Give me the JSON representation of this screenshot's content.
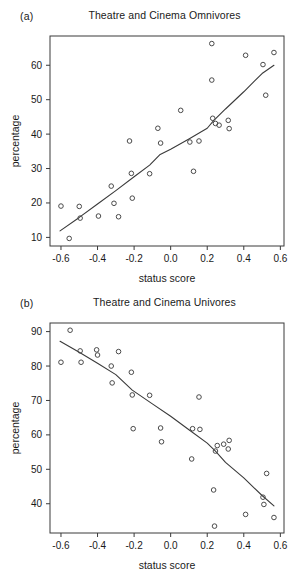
{
  "figure": {
    "xlabel": "status score",
    "ylabel": "percentage"
  },
  "panels": [
    {
      "letter": "(a)",
      "title": "Theatre and Cinema Omnivores"
    },
    {
      "letter": "(b)",
      "title": "Theatre and Cinema Univores"
    }
  ],
  "chart_data": [
    {
      "type": "scatter",
      "panel": "(a)",
      "title": "Theatre and Cinema Omnivores",
      "xlabel": "status score",
      "ylabel": "percentage",
      "xlim": [
        -0.66,
        0.62
      ],
      "ylim": [
        7.5,
        68.5
      ],
      "xticks": [
        -0.6,
        -0.4,
        -0.2,
        0.0,
        0.2,
        0.4,
        0.6
      ],
      "xticklabels": [
        "-0.6",
        "-0.4",
        "-0.2",
        "0.0",
        "0.2",
        "0.4",
        "0.6"
      ],
      "yticks": [
        10,
        20,
        30,
        40,
        50,
        60
      ],
      "yticklabels": [
        "10",
        "20",
        "30",
        "40",
        "50",
        "60"
      ],
      "grid": false,
      "legend": "none",
      "marker": "open-circle",
      "points": [
        {
          "x": -0.6,
          "y": 19.1
        },
        {
          "x": -0.555,
          "y": 9.7
        },
        {
          "x": -0.5,
          "y": 19.0
        },
        {
          "x": -0.495,
          "y": 15.6
        },
        {
          "x": -0.395,
          "y": 16.2
        },
        {
          "x": -0.325,
          "y": 24.9
        },
        {
          "x": -0.31,
          "y": 19.9
        },
        {
          "x": -0.285,
          "y": 16.0
        },
        {
          "x": -0.225,
          "y": 38.0
        },
        {
          "x": -0.215,
          "y": 28.6
        },
        {
          "x": -0.21,
          "y": 21.4
        },
        {
          "x": -0.115,
          "y": 28.5
        },
        {
          "x": -0.07,
          "y": 41.7
        },
        {
          "x": -0.055,
          "y": 37.4
        },
        {
          "x": 0.055,
          "y": 46.9
        },
        {
          "x": 0.105,
          "y": 37.7
        },
        {
          "x": 0.125,
          "y": 29.2
        },
        {
          "x": 0.155,
          "y": 38.0
        },
        {
          "x": 0.225,
          "y": 66.3
        },
        {
          "x": 0.225,
          "y": 55.7
        },
        {
          "x": 0.23,
          "y": 44.6
        },
        {
          "x": 0.245,
          "y": 43.1
        },
        {
          "x": 0.265,
          "y": 42.6
        },
        {
          "x": 0.315,
          "y": 44.0
        },
        {
          "x": 0.32,
          "y": 41.6
        },
        {
          "x": 0.41,
          "y": 62.9
        },
        {
          "x": 0.505,
          "y": 60.2
        },
        {
          "x": 0.52,
          "y": 51.3
        },
        {
          "x": 0.565,
          "y": 63.7
        }
      ],
      "fit_line": [
        {
          "x": -0.605,
          "y": 11.9
        },
        {
          "x": -0.5,
          "y": 15.8
        },
        {
          "x": -0.4,
          "y": 19.7
        },
        {
          "x": -0.3,
          "y": 23.6
        },
        {
          "x": -0.2,
          "y": 27.6
        },
        {
          "x": -0.115,
          "y": 31.0
        },
        {
          "x": -0.06,
          "y": 34.0
        },
        {
          "x": 0.0,
          "y": 35.6
        },
        {
          "x": 0.1,
          "y": 38.6
        },
        {
          "x": 0.2,
          "y": 41.7
        },
        {
          "x": 0.235,
          "y": 43.9
        },
        {
          "x": 0.3,
          "y": 47.3
        },
        {
          "x": 0.4,
          "y": 52.3
        },
        {
          "x": 0.5,
          "y": 57.6
        },
        {
          "x": 0.565,
          "y": 60.0
        }
      ]
    },
    {
      "type": "scatter",
      "panel": "(b)",
      "title": "Theatre and Cinema Univores",
      "xlabel": "status score",
      "ylabel": "percentage",
      "xlim": [
        -0.66,
        0.62
      ],
      "ylim": [
        31.5,
        92.5
      ],
      "xticks": [
        -0.6,
        -0.4,
        -0.2,
        0.0,
        0.2,
        0.4,
        0.6
      ],
      "xticklabels": [
        "-0.6",
        "-0.4",
        "-0.2",
        "0.0",
        "0.2",
        "0.4",
        "0.6"
      ],
      "yticks": [
        40,
        50,
        60,
        70,
        80,
        90
      ],
      "yticklabels": [
        "40",
        "50",
        "60",
        "70",
        "80",
        "90"
      ],
      "grid": false,
      "legend": "none",
      "marker": "open-circle",
      "points": [
        {
          "x": -0.6,
          "y": 81.1
        },
        {
          "x": -0.55,
          "y": 90.4
        },
        {
          "x": -0.495,
          "y": 84.4
        },
        {
          "x": -0.49,
          "y": 81.1
        },
        {
          "x": -0.405,
          "y": 84.7
        },
        {
          "x": -0.4,
          "y": 83.2
        },
        {
          "x": -0.325,
          "y": 80.0
        },
        {
          "x": -0.32,
          "y": 75.1
        },
        {
          "x": -0.285,
          "y": 84.2
        },
        {
          "x": -0.215,
          "y": 78.2
        },
        {
          "x": -0.21,
          "y": 71.6
        },
        {
          "x": -0.205,
          "y": 61.8
        },
        {
          "x": -0.115,
          "y": 71.5
        },
        {
          "x": -0.055,
          "y": 62.0
        },
        {
          "x": -0.05,
          "y": 58.0
        },
        {
          "x": 0.115,
          "y": 53.0
        },
        {
          "x": 0.12,
          "y": 61.8
        },
        {
          "x": 0.155,
          "y": 71.0
        },
        {
          "x": 0.16,
          "y": 61.6
        },
        {
          "x": 0.235,
          "y": 44.0
        },
        {
          "x": 0.24,
          "y": 33.5
        },
        {
          "x": 0.245,
          "y": 55.3
        },
        {
          "x": 0.255,
          "y": 56.9
        },
        {
          "x": 0.29,
          "y": 57.3
        },
        {
          "x": 0.315,
          "y": 55.9
        },
        {
          "x": 0.32,
          "y": 58.4
        },
        {
          "x": 0.41,
          "y": 36.9
        },
        {
          "x": 0.505,
          "y": 41.9
        },
        {
          "x": 0.51,
          "y": 39.8
        },
        {
          "x": 0.525,
          "y": 48.8
        },
        {
          "x": 0.565,
          "y": 36.0
        }
      ],
      "fit_line": [
        {
          "x": -0.605,
          "y": 87.2
        },
        {
          "x": -0.5,
          "y": 84.0
        },
        {
          "x": -0.4,
          "y": 80.8
        },
        {
          "x": -0.3,
          "y": 77.5
        },
        {
          "x": -0.21,
          "y": 73.0
        },
        {
          "x": -0.1,
          "y": 69.0
        },
        {
          "x": 0.0,
          "y": 65.4
        },
        {
          "x": 0.1,
          "y": 61.5
        },
        {
          "x": 0.2,
          "y": 57.6
        },
        {
          "x": 0.245,
          "y": 55.3
        },
        {
          "x": 0.3,
          "y": 52.0
        },
        {
          "x": 0.4,
          "y": 47.5
        },
        {
          "x": 0.5,
          "y": 42.4
        },
        {
          "x": 0.565,
          "y": 39.4
        }
      ]
    }
  ]
}
